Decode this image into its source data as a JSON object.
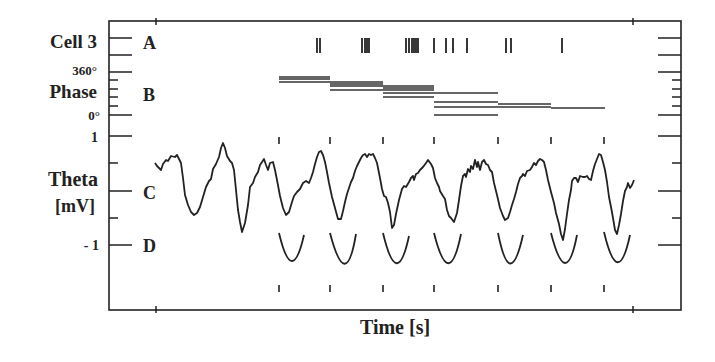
{
  "chart_data": {
    "type": "line",
    "title": "",
    "xlabel": "Time [s]",
    "ylabel": "Theta [mV]",
    "panels": [
      {
        "id": "A",
        "label": "Cell 3",
        "kind": "spike-raster",
        "spike_x_px": [
          317,
          320,
          362,
          365,
          367,
          369,
          406,
          409,
          412,
          414,
          416,
          418,
          434,
          446,
          453,
          467,
          506,
          511,
          562
        ]
      },
      {
        "id": "B",
        "label": "Phase",
        "kind": "phase-bars",
        "y_ticks": [
          "360°",
          "0°"
        ],
        "segments": [
          {
            "x0": 279,
            "x1": 330,
            "ys": [
              77,
              79,
              82
            ]
          },
          {
            "x0": 330,
            "x1": 383,
            "ys": [
              82,
              84,
              86,
              90
            ]
          },
          {
            "x0": 383,
            "x1": 434,
            "ys": [
              86,
              88,
              90,
              93,
              97
            ]
          },
          {
            "x0": 434,
            "x1": 498,
            "ys": [
              93,
              102,
              107,
              115
            ]
          },
          {
            "x0": 498,
            "x1": 551,
            "ys": [
              104,
              107
            ]
          },
          {
            "x0": 551,
            "x1": 605,
            "ys": [
              108
            ]
          }
        ]
      },
      {
        "id": "C",
        "label": "Theta [mV]",
        "kind": "eeg-trace",
        "y_ticks": [
          "1",
          "-1"
        ],
        "ylim": [
          -1,
          1
        ]
      },
      {
        "id": "D",
        "label": "",
        "kind": "fitted-troughs"
      }
    ],
    "cycle_markers_x_px": [
      279,
      330,
      383,
      434,
      498,
      551,
      604
    ],
    "x_ticks_px": [
      156,
      633
    ],
    "grid": false,
    "legend": null
  },
  "labels": {
    "cell": "Cell 3",
    "phase_top": "360°",
    "phase": "Phase",
    "phase_bottom": "0°",
    "theta_top": "1",
    "theta": "Theta",
    "theta_unit": "[mV]",
    "theta_bottom": "- 1",
    "panel_a": "A",
    "panel_b": "B",
    "panel_c": "C",
    "panel_d": "D",
    "xlabel": "Time [s]"
  }
}
